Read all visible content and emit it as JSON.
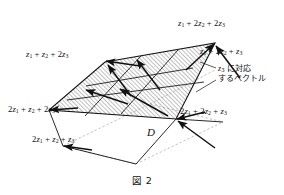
{
  "figure": {
    "caption": "図 2",
    "region_label": "D",
    "annotation": {
      "line1_prefix": "z",
      "line1_sub": "3",
      "line1_suffix": " に対応",
      "line2": "するベクトル",
      "full_text": "z3 に対応するベクトル"
    },
    "vertex_labels": [
      {
        "id": "top",
        "text": "z1 + 2z2 + 2z3",
        "terms": [
          {
            "coef": "",
            "sym": "z",
            "sub": "1"
          },
          {
            "coef": "2",
            "sym": "z",
            "sub": "2"
          },
          {
            "coef": "2",
            "sym": "z",
            "sub": "3"
          }
        ]
      },
      {
        "id": "right-upper",
        "text": "z1 + 2z2 + z3",
        "terms": [
          {
            "coef": "",
            "sym": "z",
            "sub": "1"
          },
          {
            "coef": "2",
            "sym": "z",
            "sub": "2"
          },
          {
            "coef": "",
            "sym": "z",
            "sub": "3"
          }
        ]
      },
      {
        "id": "left-upper",
        "text": "z1 + z2 + 2z3",
        "terms": [
          {
            "coef": "",
            "sym": "z",
            "sub": "1"
          },
          {
            "coef": "",
            "sym": "z",
            "sub": "2"
          },
          {
            "coef": "2",
            "sym": "z",
            "sub": "3"
          }
        ]
      },
      {
        "id": "left-lower",
        "text": "2z1 + z2 + 2z3",
        "terms": [
          {
            "coef": "2",
            "sym": "z",
            "sub": "1"
          },
          {
            "coef": "",
            "sym": "z",
            "sub": "2"
          },
          {
            "coef": "2",
            "sym": "z",
            "sub": "3"
          }
        ]
      },
      {
        "id": "bottom-left",
        "text": "2z1 + z2 + z3",
        "terms": [
          {
            "coef": "2",
            "sym": "z",
            "sub": "1"
          },
          {
            "coef": "",
            "sym": "z",
            "sub": "2"
          },
          {
            "coef": "",
            "sym": "z",
            "sub": "3"
          }
        ]
      },
      {
        "id": "right-lower",
        "text": "2z1 + 2z2 + z3",
        "terms": [
          {
            "coef": "2",
            "sym": "z",
            "sub": "1"
          },
          {
            "coef": "2",
            "sym": "z",
            "sub": "2"
          },
          {
            "coef": "",
            "sym": "z",
            "sub": "3"
          }
        ]
      }
    ],
    "colors": {
      "ink": "#111111",
      "hatch": "#5a5a5a",
      "dashed": "#9a9a9a",
      "background": "#ffffff"
    }
  }
}
